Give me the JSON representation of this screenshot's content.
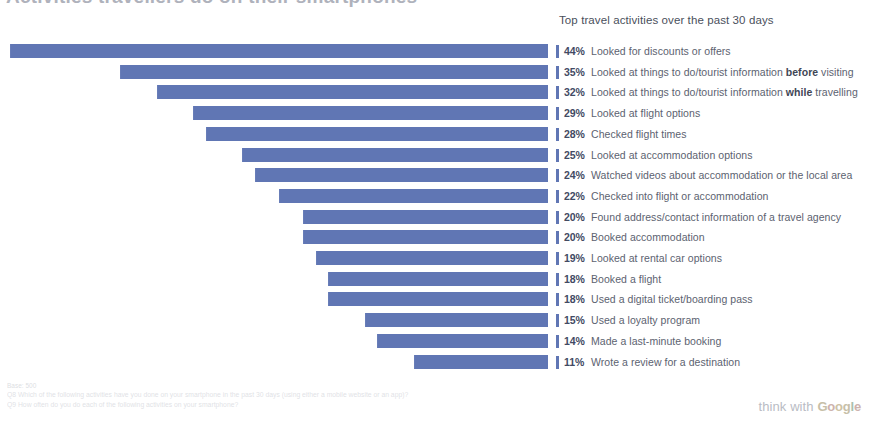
{
  "headline": "Activities travellers do on their smartphones",
  "list_heading": "Top travel activities over the past 30 days",
  "footer": {
    "base": "Base: 500",
    "q8": "Q8 Which of the following activities have you done on your smartphone in the past 30 days (using either a mobile website or an app)?",
    "q9": "Q9 How often do you do each of the following activities on your smartphone?"
  },
  "brand": {
    "think": "think",
    "with": "with",
    "g": "G",
    "o1": "o",
    "o2": "o",
    "g2": "g",
    "l": "l",
    "e": "e"
  },
  "colors": {
    "bar": "#6076b4",
    "pct_text": "#424a63",
    "label_text": "#5c6270"
  },
  "chart_data": {
    "type": "bar",
    "orientation": "horizontal",
    "title": "Top travel activities over the past 30 days",
    "xlabel": "",
    "ylabel": "",
    "xlim": [
      0,
      44
    ],
    "grid": false,
    "legend": "none",
    "unit": "%",
    "categories": [
      "Looked for discounts or offers",
      "Looked at things to do/tourist information before visiting",
      "Looked at things to do/tourist information while travelling",
      "Looked at flight options",
      "Checked flight times",
      "Looked at accommodation options",
      "Watched videos about accommodation or the local area",
      "Checked into flight or accommodation",
      "Found address/contact information of a travel agency",
      "Booked accommodation",
      "Looked at rental car options",
      "Booked a flight",
      "Used a digital ticket/boarding pass",
      "Used a loyalty program",
      "Made a last-minute booking",
      "Wrote a review for a destination"
    ],
    "values": [
      44,
      35,
      32,
      29,
      28,
      25,
      24,
      22,
      20,
      20,
      19,
      18,
      18,
      15,
      14,
      11
    ]
  },
  "rows": [
    {
      "pct": "44%",
      "pre": "Looked for discounts or offers",
      "em": "",
      "post": ""
    },
    {
      "pct": "35%",
      "pre": "Looked at things to do/tourist information ",
      "em": "before",
      "post": " visiting"
    },
    {
      "pct": "32%",
      "pre": "Looked at things to do/tourist information ",
      "em": "while",
      "post": " travelling"
    },
    {
      "pct": "29%",
      "pre": "Looked at flight options",
      "em": "",
      "post": ""
    },
    {
      "pct": "28%",
      "pre": "Checked flight times",
      "em": "",
      "post": ""
    },
    {
      "pct": "25%",
      "pre": "Looked at accommodation options",
      "em": "",
      "post": ""
    },
    {
      "pct": "24%",
      "pre": "Watched videos about accommodation or the local area",
      "em": "",
      "post": ""
    },
    {
      "pct": "22%",
      "pre": "Checked into flight or accommodation",
      "em": "",
      "post": ""
    },
    {
      "pct": "20%",
      "pre": "Found address/contact information of a travel agency",
      "em": "",
      "post": ""
    },
    {
      "pct": "20%",
      "pre": "Booked accommodation",
      "em": "",
      "post": ""
    },
    {
      "pct": "19%",
      "pre": "Looked at rental car options",
      "em": "",
      "post": ""
    },
    {
      "pct": "18%",
      "pre": "Booked a flight",
      "em": "",
      "post": ""
    },
    {
      "pct": "18%",
      "pre": "Used a digital ticket/boarding pass",
      "em": "",
      "post": ""
    },
    {
      "pct": "15%",
      "pre": "Used a loyalty program",
      "em": "",
      "post": ""
    },
    {
      "pct": "14%",
      "pre": "Made a last-minute booking",
      "em": "",
      "post": ""
    },
    {
      "pct": "11%",
      "pre": "Wrote a review for a destination",
      "em": "",
      "post": ""
    }
  ]
}
